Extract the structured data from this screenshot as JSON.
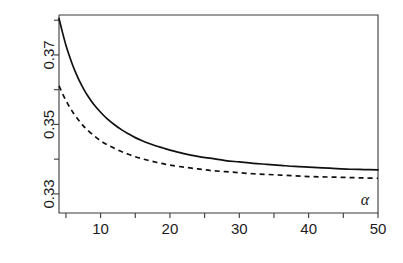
{
  "chart_data": {
    "type": "line",
    "title": "",
    "subtitle": "",
    "xlabel": "α",
    "ylabel": "",
    "xlim": [
      4,
      50
    ],
    "ylim": [
      0.3245,
      0.3815
    ],
    "grid": false,
    "legend": "none",
    "x_ticks": [
      10,
      20,
      30,
      40,
      50
    ],
    "x_tick_labels": [
      "10",
      "20",
      "30",
      "40",
      "50"
    ],
    "x_minor_ticks": [
      5,
      15,
      25,
      35,
      45
    ],
    "y_ticks": [
      0.33,
      0.35,
      0.37
    ],
    "y_tick_labels": [
      "0.33",
      "0.35",
      "0.37"
    ],
    "y_minor_ticks": [
      0.34,
      0.36,
      0.38
    ],
    "x": [
      4,
      4.5,
      5,
      5.5,
      6,
      6.5,
      7,
      7.5,
      8,
      9,
      10,
      11,
      12,
      13,
      14,
      15,
      16,
      17,
      18,
      19,
      20,
      22,
      24,
      26,
      28,
      30,
      32,
      34,
      36,
      38,
      40,
      42,
      44,
      46,
      48,
      50
    ],
    "series": [
      {
        "name": "solid-curve",
        "style": "solid",
        "values": [
          0.3805,
          0.3765,
          0.3728,
          0.3697,
          0.3669,
          0.3645,
          0.3623,
          0.3604,
          0.3587,
          0.3558,
          0.3535,
          0.3515,
          0.3499,
          0.3485,
          0.3473,
          0.3462,
          0.3453,
          0.3445,
          0.3438,
          0.3432,
          0.3426,
          0.3416,
          0.3408,
          0.3402,
          0.3396,
          0.3392,
          0.3388,
          0.3385,
          0.3382,
          0.3379,
          0.3377,
          0.3375,
          0.3373,
          0.3371,
          0.337,
          0.3369
        ]
      },
      {
        "name": "dashed-curve",
        "style": "dashed",
        "values": [
          0.3611,
          0.3589,
          0.3569,
          0.3551,
          0.3535,
          0.3521,
          0.3508,
          0.3496,
          0.3486,
          0.3468,
          0.3453,
          0.3441,
          0.3431,
          0.3422,
          0.3414,
          0.3407,
          0.3401,
          0.3396,
          0.3391,
          0.3387,
          0.3383,
          0.3377,
          0.3372,
          0.3367,
          0.3364,
          0.3361,
          0.3358,
          0.3356,
          0.3354,
          0.3352,
          0.335,
          0.3349,
          0.3348,
          0.3347,
          0.3346,
          0.3345
        ]
      }
    ],
    "colors": {
      "axis": "#3a3a3a",
      "solid_series": "#111111",
      "dashed_series": "#111111",
      "background": "#ffffff"
    }
  }
}
